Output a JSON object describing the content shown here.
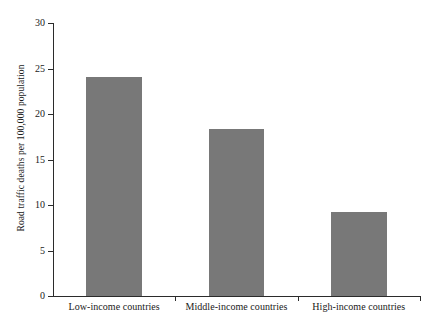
{
  "chart_data": {
    "type": "bar",
    "title": "",
    "subtitle": "",
    "xlabel": "",
    "ylabel": "Road traffic deaths per 100,000 population",
    "categories": [
      "Low-income countries",
      "Middle-income countries",
      "High-income countries"
    ],
    "values": [
      24.1,
      18.3,
      9.2
    ],
    "series": [
      {
        "name": "Road traffic deaths per 100,000 population",
        "values": [
          24.1,
          18.3,
          9.2
        ]
      }
    ],
    "ylim": [
      0,
      30
    ],
    "yticks": [
      0,
      5,
      10,
      15,
      20,
      25,
      30
    ],
    "ytick_labels": [
      "0",
      "5",
      "10",
      "15",
      "20",
      "25",
      "30"
    ],
    "grid": false,
    "legend": null,
    "legend_position": "none",
    "annotations": [],
    "bar_color": "#787878",
    "axis_color": "#2b2b2b",
    "background_color": "#ffffff"
  }
}
